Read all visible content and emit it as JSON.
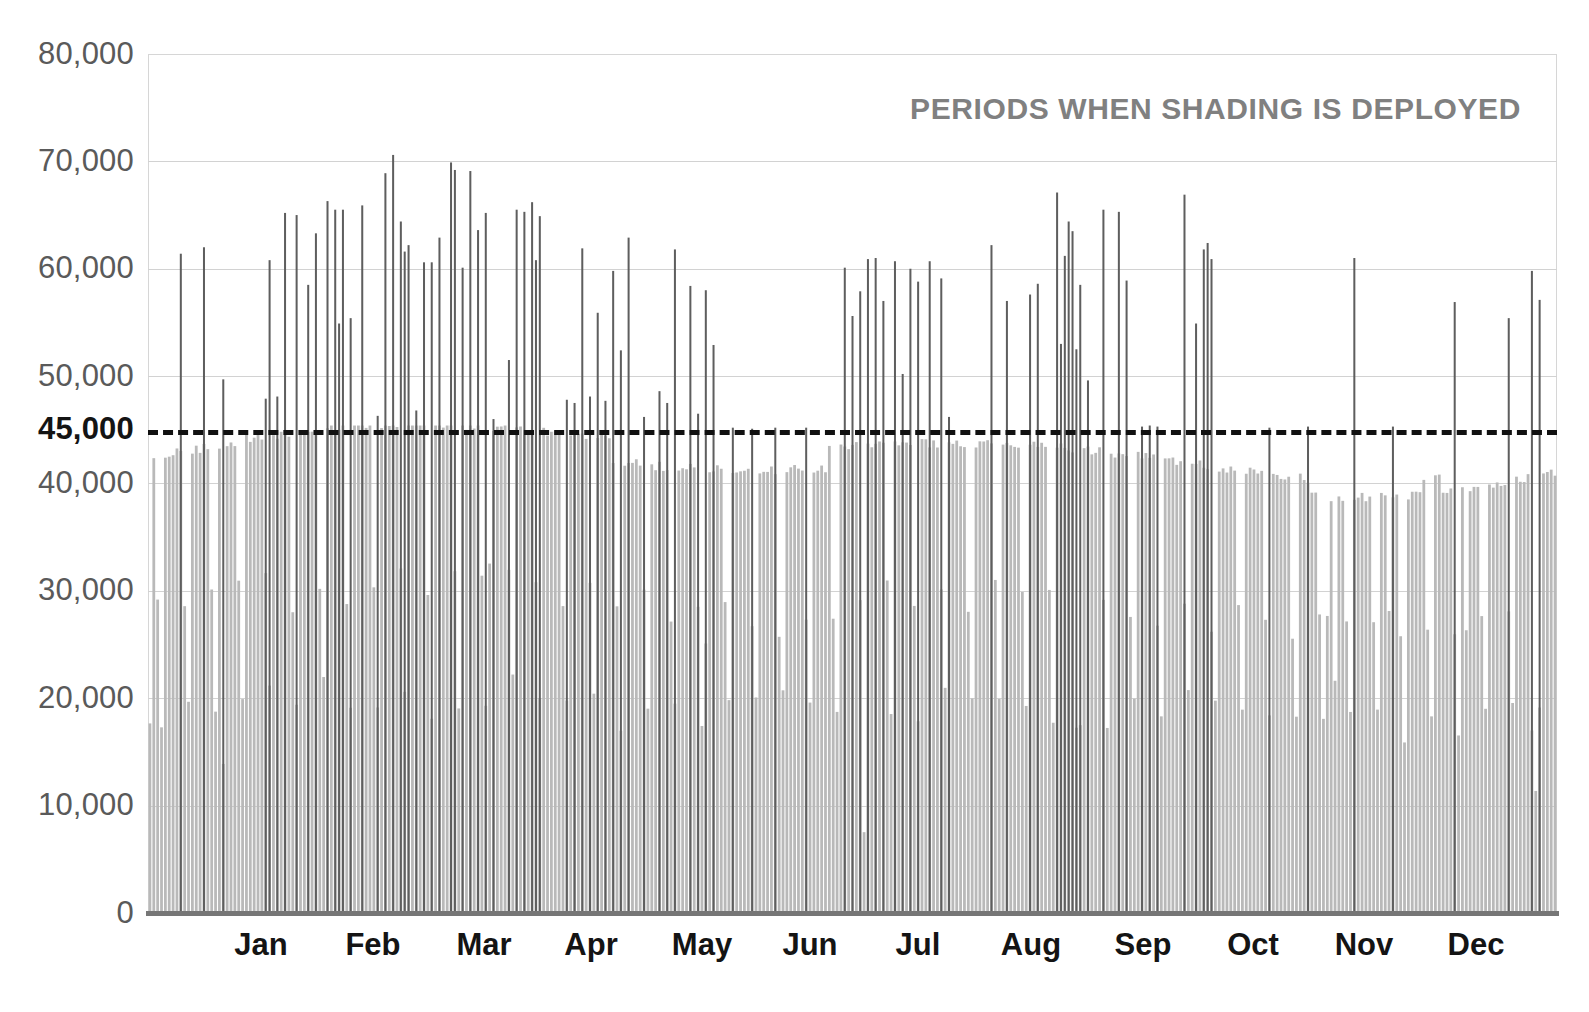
{
  "chart_data": {
    "type": "bar",
    "title": "PERIODS WHEN SHADING IS DEPLOYED",
    "xlabel": "",
    "ylabel": "",
    "ylim": [
      0,
      80000
    ],
    "grid": true,
    "legend": "none",
    "y_ticks": [
      {
        "value": 80000,
        "label": "80,000"
      },
      {
        "value": 70000,
        "label": "70,000"
      },
      {
        "value": 60000,
        "label": "60,000"
      },
      {
        "value": 50000,
        "label": "50,000"
      },
      {
        "value": 45000,
        "label": "45,000"
      },
      {
        "value": 40000,
        "label": "40,000"
      },
      {
        "value": 30000,
        "label": "30,000"
      },
      {
        "value": 20000,
        "label": "20,000"
      },
      {
        "value": 10000,
        "label": "10,000"
      },
      {
        "value": 0,
        "label": "0"
      }
    ],
    "x_tick_labels": [
      "Jan",
      "Feb",
      "Mar",
      "Apr",
      "May",
      "Jun",
      "Jul",
      "Aug",
      "Sep",
      "Oct",
      "Nov",
      "Dec"
    ],
    "threshold": {
      "value": 45000,
      "label": "45,000",
      "style": "dashed",
      "color": "#111111"
    },
    "colors": {
      "base_bars": "#b9b9b9",
      "spike_bars": "#5e5e5e",
      "gridline": "#d2d2d2",
      "axis": "#767676",
      "tick_label": "#5a5a5a",
      "title": "#808080",
      "threshold": "#111111"
    },
    "series": [
      {
        "name": "Daily peak demand (base)",
        "note": "Light grey daily bars, one per day of the year, peaking near 45,000 on weekdays and dipping to 15,000-30,000 on weekends/holidays.",
        "color": "#b9b9b9"
      },
      {
        "name": "Daily peak demand when shading is deployed",
        "note": "Dark grey spikes exceeding the 45,000 threshold; most frequent Jan-Apr and Jul-Oct, sparse in Jun and Nov-Dec. Maximum about 70,600.",
        "color": "#5e5e5e"
      }
    ],
    "spikes": [
      {
        "day": 8,
        "value": 61400
      },
      {
        "day": 14,
        "value": 62000
      },
      {
        "day": 19,
        "value": 49700
      },
      {
        "day": 30,
        "value": 47900
      },
      {
        "day": 31,
        "value": 60800
      },
      {
        "day": 33,
        "value": 48100
      },
      {
        "day": 35,
        "value": 65200
      },
      {
        "day": 38,
        "value": 65000
      },
      {
        "day": 41,
        "value": 58500
      },
      {
        "day": 43,
        "value": 63300
      },
      {
        "day": 46,
        "value": 66300
      },
      {
        "day": 48,
        "value": 65500
      },
      {
        "day": 49,
        "value": 54900
      },
      {
        "day": 50,
        "value": 65500
      },
      {
        "day": 52,
        "value": 55400
      },
      {
        "day": 55,
        "value": 65900
      },
      {
        "day": 59,
        "value": 46300
      },
      {
        "day": 61,
        "value": 68900
      },
      {
        "day": 63,
        "value": 70600
      },
      {
        "day": 65,
        "value": 64400
      },
      {
        "day": 66,
        "value": 61600
      },
      {
        "day": 67,
        "value": 62200
      },
      {
        "day": 69,
        "value": 46800
      },
      {
        "day": 71,
        "value": 60600
      },
      {
        "day": 73,
        "value": 60600
      },
      {
        "day": 75,
        "value": 62900
      },
      {
        "day": 78,
        "value": 69900
      },
      {
        "day": 79,
        "value": 69200
      },
      {
        "day": 81,
        "value": 60100
      },
      {
        "day": 83,
        "value": 69100
      },
      {
        "day": 85,
        "value": 63600
      },
      {
        "day": 87,
        "value": 65200
      },
      {
        "day": 89,
        "value": 46000
      },
      {
        "day": 93,
        "value": 51500
      },
      {
        "day": 95,
        "value": 65500
      },
      {
        "day": 97,
        "value": 65300
      },
      {
        "day": 99,
        "value": 66200
      },
      {
        "day": 100,
        "value": 60800
      },
      {
        "day": 101,
        "value": 64900
      },
      {
        "day": 108,
        "value": 47800
      },
      {
        "day": 110,
        "value": 47500
      },
      {
        "day": 112,
        "value": 61900
      },
      {
        "day": 114,
        "value": 48100
      },
      {
        "day": 116,
        "value": 55900
      },
      {
        "day": 118,
        "value": 47700
      },
      {
        "day": 120,
        "value": 59800
      },
      {
        "day": 122,
        "value": 52400
      },
      {
        "day": 124,
        "value": 62900
      },
      {
        "day": 128,
        "value": 46200
      },
      {
        "day": 132,
        "value": 48600
      },
      {
        "day": 134,
        "value": 47500
      },
      {
        "day": 136,
        "value": 61800
      },
      {
        "day": 140,
        "value": 58400
      },
      {
        "day": 142,
        "value": 46500
      },
      {
        "day": 144,
        "value": 58000
      },
      {
        "day": 146,
        "value": 52900
      },
      {
        "day": 151,
        "value": 45200
      },
      {
        "day": 156,
        "value": 45100
      },
      {
        "day": 162,
        "value": 45200
      },
      {
        "day": 170,
        "value": 45200
      },
      {
        "day": 180,
        "value": 60100
      },
      {
        "day": 182,
        "value": 55600
      },
      {
        "day": 184,
        "value": 57900
      },
      {
        "day": 186,
        "value": 60900
      },
      {
        "day": 188,
        "value": 61000
      },
      {
        "day": 190,
        "value": 57000
      },
      {
        "day": 193,
        "value": 60700
      },
      {
        "day": 195,
        "value": 50200
      },
      {
        "day": 197,
        "value": 60000
      },
      {
        "day": 199,
        "value": 58800
      },
      {
        "day": 202,
        "value": 60700
      },
      {
        "day": 205,
        "value": 59100
      },
      {
        "day": 207,
        "value": 46200
      },
      {
        "day": 218,
        "value": 62200
      },
      {
        "day": 222,
        "value": 57000
      },
      {
        "day": 228,
        "value": 57600
      },
      {
        "day": 230,
        "value": 58600
      },
      {
        "day": 235,
        "value": 67100
      },
      {
        "day": 236,
        "value": 53000
      },
      {
        "day": 237,
        "value": 61200
      },
      {
        "day": 238,
        "value": 64400
      },
      {
        "day": 239,
        "value": 63500
      },
      {
        "day": 240,
        "value": 52500
      },
      {
        "day": 241,
        "value": 58500
      },
      {
        "day": 243,
        "value": 49600
      },
      {
        "day": 247,
        "value": 65500
      },
      {
        "day": 251,
        "value": 65300
      },
      {
        "day": 253,
        "value": 58900
      },
      {
        "day": 257,
        "value": 45300
      },
      {
        "day": 259,
        "value": 45400
      },
      {
        "day": 261,
        "value": 45300
      },
      {
        "day": 268,
        "value": 66900
      },
      {
        "day": 271,
        "value": 54900
      },
      {
        "day": 273,
        "value": 61800
      },
      {
        "day": 274,
        "value": 62400
      },
      {
        "day": 275,
        "value": 60900
      },
      {
        "day": 290,
        "value": 45200
      },
      {
        "day": 300,
        "value": 45300
      },
      {
        "day": 312,
        "value": 61000
      },
      {
        "day": 322,
        "value": 45300
      },
      {
        "day": 338,
        "value": 56900
      },
      {
        "day": 352,
        "value": 55400
      },
      {
        "day": 358,
        "value": 59800
      },
      {
        "day": 360,
        "value": 57100
      }
    ]
  }
}
